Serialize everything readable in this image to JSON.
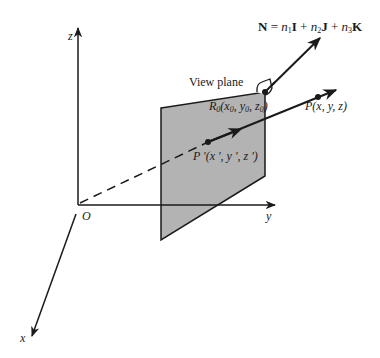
{
  "diagram": {
    "axes": {
      "z": "z",
      "y": "y",
      "x": "x",
      "origin": "O"
    },
    "labels": {
      "view_plane": "View plane",
      "normal_vector": {
        "N": "N",
        "eq": "=",
        "n1": "n",
        "n1_sub": "1",
        "I": "I",
        "plus1": "+",
        "n2": "n",
        "n2_sub": "2",
        "J": "J",
        "plus2": "+",
        "n3": "n",
        "n3_sub": "3",
        "K": "K"
      },
      "R0": {
        "R": "R",
        "R_sub": "0",
        "open": "(",
        "x": "x",
        "x_sub": "0",
        "c1": ", ",
        "y": "y",
        "y_sub": "0",
        "c2": ", ",
        "z": "z",
        "z_sub": "0",
        "close": ")"
      },
      "P": "P(x, y, z)",
      "P_prime": "P '(x ', y ', z ')"
    },
    "colors": {
      "plane_fill": "#b3b3b3",
      "line": "#1a1a1a",
      "background": "#ffffff"
    }
  }
}
